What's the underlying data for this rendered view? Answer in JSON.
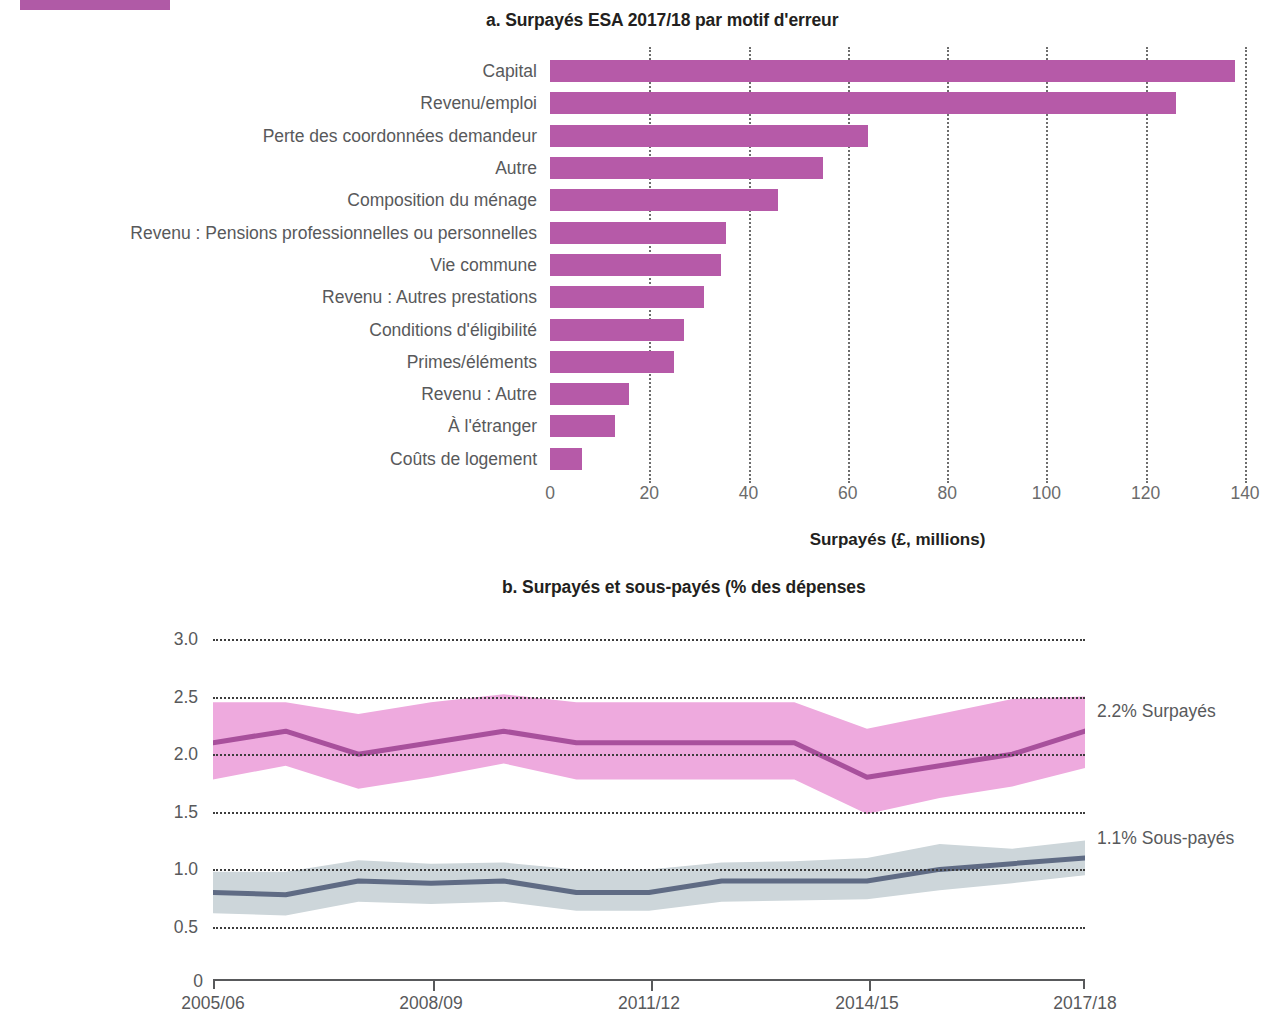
{
  "stray_element": {
    "name": "cropped-legend-swatch",
    "color": "#b05aa6"
  },
  "chart_data": [
    {
      "id": "a",
      "type": "bar",
      "orientation": "horizontal",
      "title": "a. Surpayés ESA 2017/18 par motif d'erreur",
      "xlabel": "Surpayés (£, millions)",
      "ylabel": "",
      "xlim": [
        0,
        140
      ],
      "xticks": [
        "0",
        "20",
        "40",
        "60",
        "80",
        "100",
        "120",
        "140"
      ],
      "xtick_values": [
        0,
        20,
        40,
        60,
        80,
        100,
        120,
        140
      ],
      "grid": "vertical-dotted",
      "bar_color": "#b65aa8",
      "categories": [
        "Capital",
        "Revenu/emploi",
        "Perte des coordonnées demandeur",
        "Autre",
        "Composition du ménage",
        "Revenu : Pensions professionnelles ou personnelles",
        "Vie commune",
        "Revenu : Autres prestations",
        "Conditions d'éligibilité",
        "Primes/éléments",
        "Revenu : Autre",
        "À l'étranger",
        "Coûts de logement"
      ],
      "values": [
        138,
        126,
        64,
        55,
        46,
        35.5,
        34.5,
        31,
        27,
        25,
        16,
        13,
        6.5
      ]
    },
    {
      "id": "b",
      "type": "area",
      "title": "b. Surpayés et sous-payés (% des dépenses",
      "xlabel": "",
      "ylabel": "Pourcentage",
      "ylim": [
        0,
        3.0
      ],
      "yticks": [
        "3.0",
        "2.5",
        "2.0",
        "1.5",
        "1.0",
        "0.5",
        "0"
      ],
      "ytick_values": [
        3.0,
        2.5,
        2.0,
        1.5,
        1.0,
        0.5,
        0
      ],
      "grid": "horizontal-dotted",
      "xticks": [
        "2005/06",
        "2008/09",
        "2011/12",
        "2014/15",
        "2017/18"
      ],
      "x": [
        "2005/06",
        "2006/07",
        "2007/08",
        "2008/09",
        "2009/10",
        "2010/11",
        "2011/12",
        "2012/13",
        "2013/14",
        "2014/15",
        "2015/16",
        "2016/17",
        "2017/18"
      ],
      "series": [
        {
          "name": "Surpayés",
          "end_label": "2.2% Surpayés",
          "line_color": "#a8509c",
          "band_color": "#eeaade",
          "values": [
            2.1,
            2.2,
            2.0,
            2.1,
            2.2,
            2.1,
            2.1,
            2.1,
            2.1,
            1.8,
            1.9,
            2.0,
            2.2
          ],
          "band_upper": [
            2.45,
            2.45,
            2.35,
            2.45,
            2.52,
            2.45,
            2.45,
            2.45,
            2.45,
            2.22,
            2.35,
            2.48,
            2.5
          ],
          "band_lower": [
            1.78,
            1.9,
            1.7,
            1.8,
            1.92,
            1.78,
            1.78,
            1.78,
            1.78,
            1.48,
            1.62,
            1.72,
            1.88
          ]
        },
        {
          "name": "Sous-payés",
          "end_label": "1.1% Sous-payés",
          "line_color": "#5f6b84",
          "band_color": "#cdd6da",
          "values": [
            0.8,
            0.78,
            0.9,
            0.88,
            0.9,
            0.8,
            0.8,
            0.9,
            0.9,
            0.9,
            1.0,
            1.05,
            1.1
          ],
          "band_upper": [
            0.98,
            0.98,
            1.08,
            1.05,
            1.06,
            1.0,
            1.0,
            1.06,
            1.07,
            1.1,
            1.22,
            1.18,
            1.25
          ],
          "band_lower": [
            0.62,
            0.6,
            0.72,
            0.7,
            0.72,
            0.64,
            0.64,
            0.72,
            0.73,
            0.74,
            0.82,
            0.88,
            0.95
          ]
        }
      ]
    }
  ]
}
